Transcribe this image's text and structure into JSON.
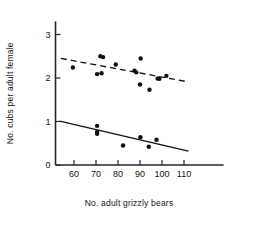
{
  "chart_data": {
    "type": "scatter",
    "title": "",
    "xlabel": "No. adult grizzly bears",
    "ylabel": "No. cubs per adult female",
    "xlim": [
      52,
      118
    ],
    "ylim": [
      0,
      3.3
    ],
    "xticks": [
      60,
      70,
      80,
      90,
      100,
      110
    ],
    "yticks": [
      0,
      1,
      2,
      3
    ],
    "xtick_labels": [
      "60",
      "70",
      "80",
      "90",
      "100",
      "110"
    ],
    "ytick_labels": [
      "0",
      "1",
      "2",
      "3"
    ],
    "grid": false,
    "legend": "none",
    "series": [
      {
        "name": "upper-group",
        "marker": "filled-circle",
        "color": "#111111",
        "points": [
          {
            "x": 59.5,
            "y": 2.24
          },
          {
            "x": 70.5,
            "y": 2.09
          },
          {
            "x": 72.5,
            "y": 2.11
          },
          {
            "x": 72.0,
            "y": 2.5
          },
          {
            "x": 73.2,
            "y": 2.48
          },
          {
            "x": 79.0,
            "y": 2.31
          },
          {
            "x": 87.5,
            "y": 2.17
          },
          {
            "x": 88.3,
            "y": 2.13
          },
          {
            "x": 90.3,
            "y": 2.45
          },
          {
            "x": 90.0,
            "y": 1.85
          },
          {
            "x": 94.3,
            "y": 1.73
          },
          {
            "x": 98.0,
            "y": 1.99
          },
          {
            "x": 98.8,
            "y": 1.98
          },
          {
            "x": 102.0,
            "y": 2.05
          }
        ],
        "fit_line": {
          "style": "dashed",
          "x1": 54.0,
          "y1": 2.45,
          "x2": 112.0,
          "y2": 1.91
        }
      },
      {
        "name": "lower-group",
        "marker": "filled-circle",
        "color": "#111111",
        "points": [
          {
            "x": 70.5,
            "y": 0.9
          },
          {
            "x": 70.5,
            "y": 0.76
          },
          {
            "x": 70.5,
            "y": 0.72
          },
          {
            "x": 82.3,
            "y": 0.45
          },
          {
            "x": 90.2,
            "y": 0.64
          },
          {
            "x": 94.0,
            "y": 0.42
          },
          {
            "x": 97.5,
            "y": 0.58
          }
        ],
        "fit_line": {
          "style": "solid",
          "x1": 53.5,
          "y1": 1.01,
          "x2": 112.0,
          "y2": 0.32
        }
      }
    ]
  }
}
